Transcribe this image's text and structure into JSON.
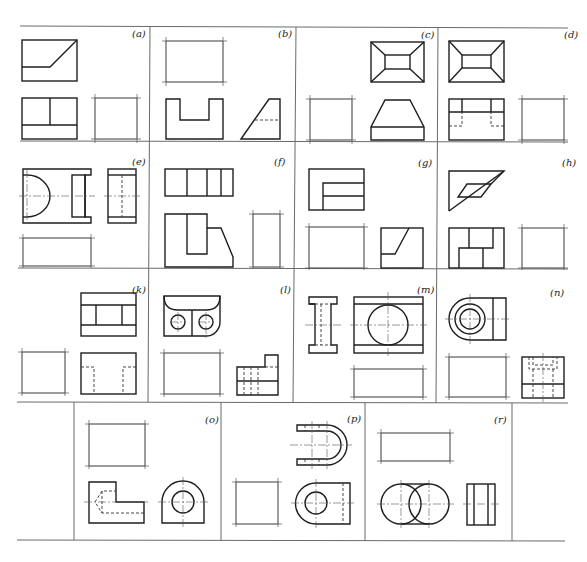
{
  "figure": {
    "colors": {
      "line": "#1e1e1e",
      "frame": "#6a6a6a",
      "background": "#ffffff"
    },
    "rows": [
      {
        "panels": [
          {
            "label": "(a)",
            "given_views": [
              "top: rectangle with diagonal step",
              "front: rectangle split into three regions"
            ],
            "blank_view": "side"
          },
          {
            "label": "(b)",
            "given_views": [
              "front: U-shaped channel",
              "side: trapezoid with hidden line"
            ],
            "blank_view": "top"
          },
          {
            "label": "(c)",
            "given_views": [
              "top: frustum (rectangle with inner rectangle and corner diagonals)",
              "front: trapezoid on rectangular base"
            ],
            "blank_view": "side (left)"
          },
          {
            "label": "(d)",
            "given_views": [
              "top: frustum (rectangle with inner rectangle and corner diagonals)",
              "front: rectangle with notches and hidden lines"
            ],
            "blank_view": "side"
          }
        ]
      },
      {
        "panels": [
          {
            "label": "(e)",
            "given_views": [
              "front: flanged block with semicircular boss",
              "side: rectangle with hidden line"
            ],
            "blank_view": "top"
          },
          {
            "label": "(f)",
            "given_views": [
              "top: rectangle divided into four segments",
              "front: L-shaped profile with chamfer"
            ],
            "blank_view": "side"
          },
          {
            "label": "(g)",
            "given_views": [
              "top: rectangle with inset step",
              "side: square with inclined line"
            ],
            "blank_view": "front"
          },
          {
            "label": "(h)",
            "given_views": [
              "top: triangular/parallelogram shape",
              "front: rectangle with stepped divisions"
            ],
            "blank_view": "side"
          }
        ]
      },
      {
        "panels": [
          {
            "label": "(k)",
            "given_views": [
              "top: rectangle with inner rectangle",
              "side: T-profile with hidden lines"
            ],
            "blank_view": "front"
          },
          {
            "label": "(l)",
            "given_views": [
              "top: rounded block with two holes",
              "side: stepped profile with hidden lines"
            ],
            "blank_view": "front"
          },
          {
            "label": "(m)",
            "given_views": [
              "side: I-shaped profile",
              "front: rectangle with circle"
            ],
            "blank_view": "top"
          },
          {
            "label": "(n)",
            "given_views": [
              "front: concentric circles with rectangle",
              "side: rectangle with hidden counterbore"
            ],
            "blank_view": "top"
          }
        ]
      },
      {
        "panels": [
          {
            "label": "(o)",
            "given_views": [
              "front: L-shape with hidden conical hole",
              "side: rounded block with circle"
            ],
            "blank_view": "top"
          },
          {
            "label": "(p)",
            "given_views": [
              "top: U-shaped clevis",
              "side: rounded block with circle"
            ],
            "blank_view": "front"
          },
          {
            "label": "(r)",
            "given_views": [
              "front: two overlapping circles",
              "side: rectangle with vertical lines"
            ],
            "blank_view": "top"
          }
        ]
      }
    ]
  }
}
